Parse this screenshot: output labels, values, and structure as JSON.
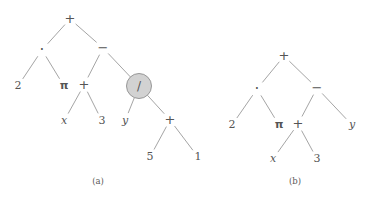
{
  "figure": {
    "background_color": "#ffffff",
    "edge_color": "#9a9a9a",
    "text_color": "#555555",
    "highlight_fill": "#d2d2d2",
    "highlight_stroke": "#8e8e8e",
    "width": 368,
    "height": 197
  },
  "captions": [
    {
      "id": "caption-a",
      "text": "(a)",
      "x": 98,
      "y": 181
    },
    {
      "id": "caption-b",
      "text": "(b)",
      "x": 295,
      "y": 181
    }
  ],
  "trees": [
    {
      "id": "tree-a",
      "caption": "(a)",
      "expression": "2 · π + (x + 3) − y / (5 + 1)",
      "nodes": [
        {
          "id": "a-root-plus",
          "label": "+",
          "kind": "operator",
          "style": "op-plus",
          "x": 70,
          "y": 19,
          "highlight": false
        },
        {
          "id": "a-dot",
          "label": "·",
          "kind": "operator",
          "style": "op-dot",
          "x": 42,
          "y": 50,
          "highlight": false
        },
        {
          "id": "a-minus",
          "label": "−",
          "kind": "operator",
          "style": "op-minus",
          "x": 103,
          "y": 48,
          "highlight": false
        },
        {
          "id": "a-two",
          "label": "2",
          "kind": "number",
          "style": "num",
          "x": 18,
          "y": 86,
          "highlight": false
        },
        {
          "id": "a-pi",
          "label": "π",
          "kind": "constant",
          "style": "greek",
          "x": 64,
          "y": 86,
          "highlight": false
        },
        {
          "id": "a-plus-mid",
          "label": "+",
          "kind": "operator",
          "style": "op-plus",
          "x": 84,
          "y": 85,
          "highlight": false
        },
        {
          "id": "a-div",
          "label": "/",
          "kind": "operator",
          "style": "op-div",
          "x": 139,
          "y": 86,
          "highlight": true
        },
        {
          "id": "a-x",
          "label": "x",
          "kind": "variable",
          "style": "ital",
          "x": 64,
          "y": 121,
          "highlight": false
        },
        {
          "id": "a-three",
          "label": "3",
          "kind": "number",
          "style": "num",
          "x": 102,
          "y": 121,
          "highlight": false
        },
        {
          "id": "a-y",
          "label": "y",
          "kind": "variable",
          "style": "ital",
          "x": 125,
          "y": 121,
          "highlight": false
        },
        {
          "id": "a-plus-low",
          "label": "+",
          "kind": "operator",
          "style": "op-plus",
          "x": 170,
          "y": 120,
          "highlight": false
        },
        {
          "id": "a-five",
          "label": "5",
          "kind": "number",
          "style": "num",
          "x": 150,
          "y": 157,
          "highlight": false
        },
        {
          "id": "a-one",
          "label": "1",
          "kind": "number",
          "style": "num",
          "x": 198,
          "y": 157,
          "highlight": false
        }
      ],
      "edges": [
        {
          "from": "a-root-plus",
          "to": "a-dot"
        },
        {
          "from": "a-root-plus",
          "to": "a-minus"
        },
        {
          "from": "a-dot",
          "to": "a-two"
        },
        {
          "from": "a-dot",
          "to": "a-pi"
        },
        {
          "from": "a-minus",
          "to": "a-plus-mid"
        },
        {
          "from": "a-minus",
          "to": "a-div"
        },
        {
          "from": "a-plus-mid",
          "to": "a-x"
        },
        {
          "from": "a-plus-mid",
          "to": "a-three"
        },
        {
          "from": "a-div",
          "to": "a-y"
        },
        {
          "from": "a-div",
          "to": "a-plus-low"
        },
        {
          "from": "a-plus-low",
          "to": "a-five"
        },
        {
          "from": "a-plus-low",
          "to": "a-one"
        }
      ],
      "highlighted_node": "a-div",
      "highlight_radius": 12.5
    },
    {
      "id": "tree-b",
      "caption": "(b)",
      "expression": "2 · π + (x + 3) − y",
      "nodes": [
        {
          "id": "b-root-plus",
          "label": "+",
          "kind": "operator",
          "style": "op-plus",
          "x": 284,
          "y": 56,
          "highlight": false
        },
        {
          "id": "b-dot",
          "label": "·",
          "kind": "operator",
          "style": "op-dot",
          "x": 257,
          "y": 89,
          "highlight": false
        },
        {
          "id": "b-minus",
          "label": "−",
          "kind": "operator",
          "style": "op-minus",
          "x": 317,
          "y": 88,
          "highlight": false
        },
        {
          "id": "b-two",
          "label": "2",
          "kind": "number",
          "style": "num",
          "x": 232,
          "y": 125,
          "highlight": false
        },
        {
          "id": "b-pi",
          "label": "π",
          "kind": "constant",
          "style": "greek",
          "x": 279,
          "y": 125,
          "highlight": false
        },
        {
          "id": "b-plus-mid",
          "label": "+",
          "kind": "operator",
          "style": "op-plus",
          "x": 298,
          "y": 124,
          "highlight": false
        },
        {
          "id": "b-y",
          "label": "y",
          "kind": "variable",
          "style": "ital",
          "x": 352,
          "y": 125,
          "highlight": false
        },
        {
          "id": "b-x",
          "label": "x",
          "kind": "variable",
          "style": "ital",
          "x": 273,
          "y": 159,
          "highlight": false
        },
        {
          "id": "b-three",
          "label": "3",
          "kind": "number",
          "style": "num",
          "x": 317,
          "y": 159,
          "highlight": false
        }
      ],
      "edges": [
        {
          "from": "b-root-plus",
          "to": "b-dot"
        },
        {
          "from": "b-root-plus",
          "to": "b-minus"
        },
        {
          "from": "b-dot",
          "to": "b-two"
        },
        {
          "from": "b-dot",
          "to": "b-pi"
        },
        {
          "from": "b-minus",
          "to": "b-plus-mid"
        },
        {
          "from": "b-minus",
          "to": "b-y"
        },
        {
          "from": "b-plus-mid",
          "to": "b-x"
        },
        {
          "from": "b-plus-mid",
          "to": "b-three"
        }
      ],
      "highlighted_node": null,
      "highlight_radius": 0
    }
  ]
}
